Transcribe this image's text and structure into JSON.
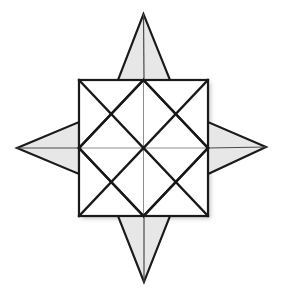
{
  "canvas": {
    "width": 283,
    "height": 296,
    "background": "#ffffff",
    "title": "Eight-pointed star / compass rose geometric figure"
  },
  "palette": {
    "background": "#ffffff",
    "spike_fill": "#e7e7e7",
    "spike_stroke": "#1a1a1a",
    "square_stroke": "#1a1a1a",
    "thick_line": "#181818",
    "thin_line": "#8e8e8e",
    "shadow": "#c9c9c9"
  },
  "geometry": {
    "square": {
      "left": 79,
      "top": 80,
      "right": 208,
      "bottom": 216,
      "center_x": 143.5,
      "center_y": 148,
      "stroke_width": 2.2
    },
    "midpoints": {
      "top": [
        143.5,
        80
      ],
      "right": [
        208,
        148
      ],
      "bottom": [
        143.5,
        216
      ],
      "left": [
        79,
        148
      ]
    },
    "spikes": [
      {
        "name": "north-spike",
        "tip": [
          143.5,
          14
        ],
        "base_a": [
          118,
          80
        ],
        "base_b": [
          170,
          80
        ]
      },
      {
        "name": "east-spike",
        "tip": [
          266,
          147
        ],
        "base_a": [
          208,
          122
        ],
        "base_b": [
          208,
          174
        ]
      },
      {
        "name": "south-spike",
        "tip": [
          144,
          282
        ],
        "base_a": [
          118,
          216
        ],
        "base_b": [
          170,
          216
        ]
      },
      {
        "name": "west-spike",
        "tip": [
          17,
          148
        ],
        "base_a": [
          79,
          122
        ],
        "base_b": [
          79,
          174
        ]
      }
    ],
    "line_widths": {
      "thick": 2.3,
      "thin": 1.0,
      "spike_outline": 2.1
    }
  },
  "chart_data": {
    "type": "diagram",
    "elements": [
      "outer-square",
      "vertical-midline",
      "horizontal-midline",
      "main-diagonal-nw-se",
      "main-diagonal-ne-sw",
      "inscribed-diamond",
      "quadrant-diagonals",
      "north-spike",
      "east-spike",
      "south-spike",
      "west-spike"
    ]
  }
}
